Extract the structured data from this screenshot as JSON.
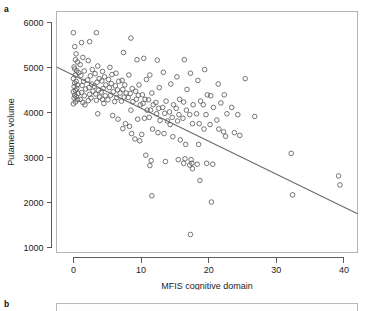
{
  "figure": {
    "panel_a_label": "a",
    "panel_b_label": "b"
  },
  "chart_data": {
    "type": "scatter",
    "title": "",
    "xlabel": "MFIS cognitive domain",
    "ylabel": "Putamen volume",
    "xlim": [
      -2.5,
      42
    ],
    "ylim": [
      900,
      6250
    ],
    "xticks": [
      0,
      10,
      20,
      30,
      40
    ],
    "xtick_labels": [
      "0",
      "10",
      "20",
      "30",
      "40"
    ],
    "yticks": [
      1000,
      2000,
      3000,
      4000,
      5000,
      6000
    ],
    "ytick_labels": [
      "1000",
      "2000",
      "3000",
      "4000",
      "5000",
      "6000"
    ],
    "grid": false,
    "legend": null,
    "marker": "open-circle",
    "marker_color": "#5d5d5d",
    "regression_line": {
      "color": "#6a6a6a",
      "x_start": -2.5,
      "y_start": 5020,
      "x_end": 42,
      "y_end": 1760,
      "slope": -73.2,
      "intercept": 4837
    },
    "points": [
      [
        0.0,
        5780
      ],
      [
        0.2,
        5470
      ],
      [
        0.4,
        5310
      ],
      [
        0.3,
        5180
      ],
      [
        0.6,
        5130
      ],
      [
        0.1,
        5020
      ],
      [
        0.2,
        4975
      ],
      [
        0.5,
        4930
      ],
      [
        0.8,
        4890
      ],
      [
        0.3,
        4840
      ],
      [
        0.0,
        4760
      ],
      [
        0.4,
        4700
      ],
      [
        0.2,
        4660
      ],
      [
        0.6,
        4620
      ],
      [
        0.1,
        4585
      ],
      [
        0.5,
        4540
      ],
      [
        0.3,
        4500
      ],
      [
        0.0,
        4470
      ],
      [
        0.7,
        4430
      ],
      [
        0.2,
        4395
      ],
      [
        0.4,
        4360
      ],
      [
        0.1,
        4330
      ],
      [
        0.6,
        4290
      ],
      [
        0.3,
        4240
      ],
      [
        0.0,
        4200
      ],
      [
        1.2,
        5560
      ],
      [
        1.4,
        5230
      ],
      [
        1.0,
        5070
      ],
      [
        1.6,
        4930
      ],
      [
        1.1,
        4830
      ],
      [
        1.5,
        4700
      ],
      [
        1.3,
        4610
      ],
      [
        1.8,
        4530
      ],
      [
        1.2,
        4450
      ],
      [
        1.6,
        4380
      ],
      [
        1.0,
        4300
      ],
      [
        1.4,
        4230
      ],
      [
        1.7,
        4180
      ],
      [
        2.4,
        5580
      ],
      [
        2.2,
        5160
      ],
      [
        2.8,
        4960
      ],
      [
        2.5,
        4820
      ],
      [
        2.1,
        4730
      ],
      [
        2.7,
        4640
      ],
      [
        2.3,
        4560
      ],
      [
        2.9,
        4480
      ],
      [
        2.4,
        4410
      ],
      [
        2.6,
        4330
      ],
      [
        2.2,
        4270
      ],
      [
        3.4,
        5780
      ],
      [
        3.6,
        5040
      ],
      [
        3.2,
        4870
      ],
      [
        3.8,
        4760
      ],
      [
        3.5,
        4680
      ],
      [
        3.1,
        4590
      ],
      [
        3.7,
        4500
      ],
      [
        3.3,
        4420
      ],
      [
        3.9,
        4350
      ],
      [
        3.4,
        4280
      ],
      [
        3.6,
        3980
      ],
      [
        4.3,
        4920
      ],
      [
        4.6,
        4800
      ],
      [
        4.2,
        4710
      ],
      [
        4.8,
        4620
      ],
      [
        4.4,
        4540
      ],
      [
        4.1,
        4460
      ],
      [
        4.7,
        4380
      ],
      [
        4.3,
        4300
      ],
      [
        4.5,
        4210
      ],
      [
        5.4,
        5010
      ],
      [
        5.7,
        4850
      ],
      [
        5.2,
        4740
      ],
      [
        5.6,
        4650
      ],
      [
        5.3,
        4560
      ],
      [
        5.9,
        4470
      ],
      [
        5.5,
        4390
      ],
      [
        5.1,
        4290
      ],
      [
        5.8,
        3940
      ],
      [
        6.3,
        4880
      ],
      [
        6.7,
        4700
      ],
      [
        6.2,
        4600
      ],
      [
        6.5,
        4510
      ],
      [
        6.9,
        4440
      ],
      [
        6.4,
        4340
      ],
      [
        6.1,
        4250
      ],
      [
        6.6,
        3860
      ],
      [
        7.4,
        5340
      ],
      [
        7.2,
        4720
      ],
      [
        7.6,
        4620
      ],
      [
        7.3,
        4520
      ],
      [
        7.8,
        4440
      ],
      [
        7.5,
        4350
      ],
      [
        7.1,
        4260
      ],
      [
        7.7,
        3760
      ],
      [
        7.3,
        3650
      ],
      [
        8.5,
        5660
      ],
      [
        8.2,
        4840
      ],
      [
        8.7,
        4540
      ],
      [
        8.4,
        4430
      ],
      [
        8.1,
        4340
      ],
      [
        8.8,
        4250
      ],
      [
        8.5,
        4060
      ],
      [
        8.3,
        3700
      ],
      [
        8.6,
        3540
      ],
      [
        9.4,
        5180
      ],
      [
        9.7,
        4620
      ],
      [
        9.2,
        4480
      ],
      [
        9.6,
        4390
      ],
      [
        9.3,
        4300
      ],
      [
        9.9,
        4180
      ],
      [
        9.5,
        3860
      ],
      [
        9.1,
        3420
      ],
      [
        9.8,
        3380
      ],
      [
        10.4,
        5210
      ],
      [
        10.8,
        4740
      ],
      [
        10.2,
        4400
      ],
      [
        10.6,
        4300
      ],
      [
        10.3,
        4210
      ],
      [
        10.9,
        4060
      ],
      [
        10.5,
        3880
      ],
      [
        10.1,
        3520
      ],
      [
        10.7,
        3060
      ],
      [
        11.3,
        4840
      ],
      [
        11.6,
        4440
      ],
      [
        11.1,
        4290
      ],
      [
        11.8,
        4180
      ],
      [
        11.4,
        4060
      ],
      [
        11.2,
        3900
      ],
      [
        11.7,
        3640
      ],
      [
        11.5,
        2940
      ],
      [
        11.3,
        2830
      ],
      [
        11.6,
        2160
      ],
      [
        12.4,
        5170
      ],
      [
        12.7,
        4560
      ],
      [
        12.2,
        4230
      ],
      [
        12.6,
        4100
      ],
      [
        12.3,
        3980
      ],
      [
        12.8,
        3830
      ],
      [
        12.5,
        3560
      ],
      [
        13.3,
        4900
      ],
      [
        13.7,
        4260
      ],
      [
        13.2,
        4120
      ],
      [
        13.5,
        3990
      ],
      [
        13.9,
        3820
      ],
      [
        13.4,
        3540
      ],
      [
        13.6,
        2920
      ],
      [
        14.4,
        4640
      ],
      [
        14.8,
        4180
      ],
      [
        14.2,
        4020
      ],
      [
        14.6,
        3900
      ],
      [
        14.3,
        3740
      ],
      [
        14.7,
        3470
      ],
      [
        15.3,
        4800
      ],
      [
        15.7,
        4300
      ],
      [
        15.2,
        4100
      ],
      [
        15.6,
        3960
      ],
      [
        15.4,
        3820
      ],
      [
        15.8,
        3400
      ],
      [
        15.5,
        2960
      ],
      [
        16.4,
        5180
      ],
      [
        16.8,
        4520
      ],
      [
        16.3,
        4240
      ],
      [
        16.7,
        4060
      ],
      [
        16.2,
        3880
      ],
      [
        16.6,
        3300
      ],
      [
        16.5,
        2980
      ],
      [
        16.3,
        2880
      ],
      [
        17.3,
        4880
      ],
      [
        17.7,
        4180
      ],
      [
        17.2,
        3960
      ],
      [
        17.6,
        3760
      ],
      [
        17.4,
        2960
      ],
      [
        17.5,
        2880
      ],
      [
        17.2,
        2840
      ],
      [
        17.6,
        2760
      ],
      [
        17.3,
        1300
      ],
      [
        18.4,
        4720
      ],
      [
        18.8,
        4260
      ],
      [
        18.2,
        3980
      ],
      [
        18.6,
        3760
      ],
      [
        18.5,
        3300
      ],
      [
        18.3,
        2860
      ],
      [
        18.7,
        2500
      ],
      [
        19.4,
        4960
      ],
      [
        19.8,
        4400
      ],
      [
        19.2,
        4180
      ],
      [
        19.6,
        3960
      ],
      [
        19.3,
        3640
      ],
      [
        19.7,
        2880
      ],
      [
        20.3,
        4380
      ],
      [
        20.7,
        4120
      ],
      [
        20.2,
        3740
      ],
      [
        20.6,
        2860
      ],
      [
        20.4,
        2020
      ],
      [
        21.4,
        4640
      ],
      [
        21.8,
        4220
      ],
      [
        21.2,
        3840
      ],
      [
        21.5,
        3640
      ],
      [
        22.3,
        4400
      ],
      [
        22.7,
        3980
      ],
      [
        22.2,
        3580
      ],
      [
        22.5,
        3480
      ],
      [
        23.4,
        4120
      ],
      [
        23.8,
        3560
      ],
      [
        24.3,
        3960
      ],
      [
        24.6,
        3500
      ],
      [
        25.4,
        4760
      ],
      [
        26.8,
        3920
      ],
      [
        32.2,
        3100
      ],
      [
        32.4,
        2180
      ],
      [
        39.2,
        2600
      ],
      [
        39.4,
        2400
      ]
    ]
  }
}
